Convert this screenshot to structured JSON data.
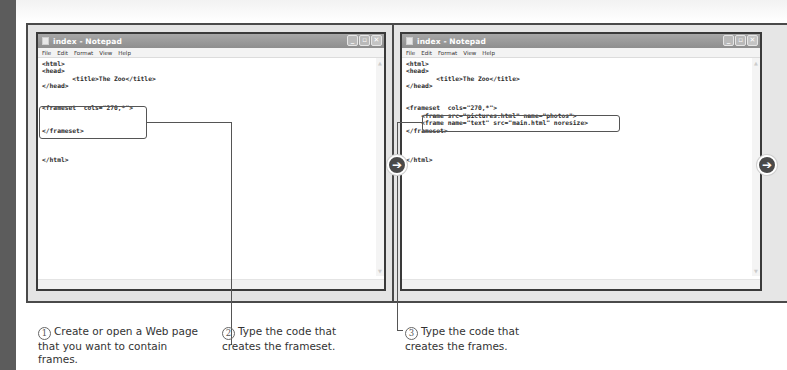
{
  "colors": {
    "left_strip": "#5c5c5c",
    "frame_border": "#4a4a4a",
    "title_bar": "#9a9a9a",
    "nav_arrow": "#4a4a4a",
    "text": "#333333"
  },
  "windows": [
    {
      "title": "index - Notepad",
      "menu": [
        "File",
        "Edit",
        "Format",
        "View",
        "Help"
      ],
      "controls": {
        "minimize": "_",
        "maximize": "▫",
        "close": "✕"
      },
      "code_lines": [
        "<html>",
        "<head>",
        "        <title>The Zoo</title>",
        "</head>",
        "",
        "",
        "<frameset  cols=\"270,*\">",
        "",
        "",
        "</frameset>",
        "",
        "",
        "",
        "</html>"
      ]
    },
    {
      "title": "index - Notepad",
      "menu": [
        "File",
        "Edit",
        "Format",
        "View",
        "Help"
      ],
      "controls": {
        "minimize": "_",
        "maximize": "▫",
        "close": "✕"
      },
      "code_lines": [
        "<html>",
        "<head>",
        "        <title>The Zoo</title>",
        "</head>",
        "",
        "",
        "<frameset  cols=\"270,*\">",
        "    <frame src=\"pictures.html\" name=\"photos\">",
        "    <frame name=\"text\" src=\"main.html\" noresize>",
        "</frameset>",
        "",
        "",
        "",
        "</html>"
      ]
    }
  ],
  "nav": {
    "middle_arrow": "➔",
    "right_arrow": "➔"
  },
  "steps": [
    {
      "number": "1",
      "text": "Create or open a Web page that you want to contain frames."
    },
    {
      "number": "2",
      "text": "Type the code that creates the frameset."
    },
    {
      "number": "3",
      "text": "Type the code that creates the frames."
    }
  ]
}
